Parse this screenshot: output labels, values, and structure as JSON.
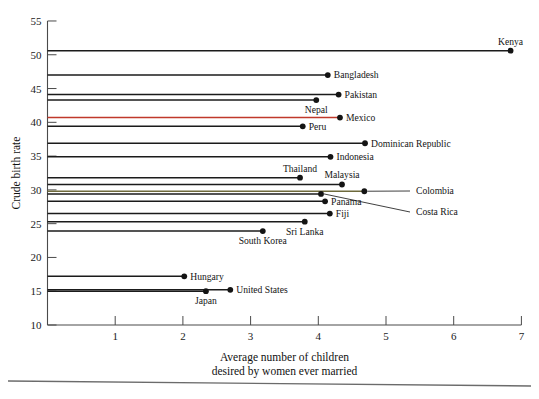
{
  "chart_data": {
    "type": "scatter",
    "title": "",
    "xlabel": "Average number of children desired by women ever married",
    "xlabel_line1": "Average number of children",
    "xlabel_line2": "desired by women ever married",
    "ylabel": "Crude birth rate",
    "xlim": [
      0,
      7
    ],
    "ylim": [
      10,
      55
    ],
    "xticks": [
      "1",
      "2",
      "3",
      "4",
      "5",
      "6",
      "7"
    ],
    "xtick_values": [
      1,
      2,
      3,
      4,
      5,
      6,
      7
    ],
    "yticks": [
      "10",
      "15",
      "20",
      "25",
      "30",
      "35",
      "40",
      "45",
      "50",
      "55"
    ],
    "ytick_values": [
      10,
      15,
      20,
      25,
      30,
      35,
      40,
      45,
      50,
      55
    ],
    "grid": false,
    "legend": "none",
    "marker": "filled-circle-with-horizontal-leader-line-to-y-axis",
    "points": [
      {
        "label": "Kenya",
        "x": 6.84,
        "y": 50.6,
        "label_side": "above",
        "color": "#1b1b1b"
      },
      {
        "label": "Bangladesh",
        "x": 4.14,
        "y": 47.0,
        "label_side": "right",
        "color": "#1b1b1b"
      },
      {
        "label": "Pakistan",
        "x": 4.3,
        "y": 44.1,
        "label_side": "right",
        "color": "#1b1b1b"
      },
      {
        "label": "Nepal",
        "x": 3.97,
        "y": 43.3,
        "label_side": "below",
        "color": "#1b1b1b"
      },
      {
        "label": "Mexico",
        "x": 4.32,
        "y": 40.7,
        "label_side": "right",
        "color": "#c0392b"
      },
      {
        "label": "Peru",
        "x": 3.77,
        "y": 39.4,
        "label_side": "right",
        "color": "#1b1b1b"
      },
      {
        "label": "Dominican Republic",
        "x": 4.69,
        "y": 36.9,
        "label_side": "right",
        "color": "#1b1b1b"
      },
      {
        "label": "Indonesia",
        "x": 4.18,
        "y": 34.9,
        "label_side": "right",
        "color": "#1b1b1b"
      },
      {
        "label": "Thailand",
        "x": 3.73,
        "y": 31.8,
        "label_side": "above",
        "color": "#1b1b1b"
      },
      {
        "label": "Malaysia",
        "x": 4.35,
        "y": 30.8,
        "label_side": "above",
        "color": "#1b1b1b"
      },
      {
        "label": "Colombia",
        "x": 4.68,
        "y": 29.8,
        "label_side": "leader",
        "color": "#6e6a3c"
      },
      {
        "label": "Costa Rica",
        "x": 4.04,
        "y": 29.4,
        "label_side": "leader",
        "color": "#1b1b1b"
      },
      {
        "label": "Panama",
        "x": 4.1,
        "y": 28.3,
        "label_side": "right",
        "color": "#1b1b1b"
      },
      {
        "label": "Fiji",
        "x": 4.17,
        "y": 26.5,
        "label_side": "right",
        "color": "#1b1b1b"
      },
      {
        "label": "Sri Lanka",
        "x": 3.8,
        "y": 25.3,
        "label_side": "below",
        "color": "#1b1b1b"
      },
      {
        "label": "South Korea",
        "x": 3.18,
        "y": 23.9,
        "label_side": "below",
        "color": "#1b1b1b"
      },
      {
        "label": "Hungary",
        "x": 2.02,
        "y": 17.2,
        "label_side": "right",
        "color": "#1b1b1b"
      },
      {
        "label": "United States",
        "x": 2.7,
        "y": 15.2,
        "label_side": "right",
        "color": "#1b1b1b"
      },
      {
        "label": "Japan",
        "x": 2.34,
        "y": 15.0,
        "label_side": "below",
        "color": "#1b1b1b"
      }
    ]
  }
}
